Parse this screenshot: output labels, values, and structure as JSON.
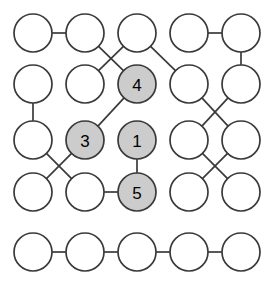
{
  "figure": {
    "width": 275,
    "height": 285,
    "background_color": "#ffffff"
  },
  "style": {
    "node_radius": 19,
    "node_stroke_color": "#3a3a3a",
    "node_stroke_width": 1.7,
    "node_fill_plain": "#ffffff",
    "node_fill_highlight": "#cccccc",
    "edge_color": "#3a3a3a",
    "edge_width": 1.7,
    "label_color": "#000000",
    "label_font_size": 17
  },
  "chart_data": {
    "type": "diagram",
    "title": "",
    "grid": {
      "columns": 5,
      "rows": 5,
      "column_centers_x": [
        33,
        85,
        137,
        189,
        241
      ],
      "row_centers_y": [
        33,
        84,
        140,
        192,
        252
      ]
    },
    "nodes": [
      {
        "id": "r1c1",
        "row": 1,
        "col": 1,
        "cx": 33,
        "cy": 33,
        "label": "",
        "highlighted": false
      },
      {
        "id": "r1c2",
        "row": 1,
        "col": 2,
        "cx": 85,
        "cy": 33,
        "label": "",
        "highlighted": false
      },
      {
        "id": "r1c3",
        "row": 1,
        "col": 3,
        "cx": 137,
        "cy": 33,
        "label": "",
        "highlighted": false
      },
      {
        "id": "r1c4",
        "row": 1,
        "col": 4,
        "cx": 189,
        "cy": 33,
        "label": "",
        "highlighted": false
      },
      {
        "id": "r1c5",
        "row": 1,
        "col": 5,
        "cx": 241,
        "cy": 33,
        "label": "",
        "highlighted": false
      },
      {
        "id": "r2c1",
        "row": 2,
        "col": 1,
        "cx": 33,
        "cy": 84,
        "label": "",
        "highlighted": false
      },
      {
        "id": "r2c2",
        "row": 2,
        "col": 2,
        "cx": 85,
        "cy": 84,
        "label": "",
        "highlighted": false
      },
      {
        "id": "r2c3",
        "row": 2,
        "col": 3,
        "cx": 137,
        "cy": 84,
        "label": "4",
        "highlighted": true
      },
      {
        "id": "r2c4",
        "row": 2,
        "col": 4,
        "cx": 189,
        "cy": 84,
        "label": "",
        "highlighted": false
      },
      {
        "id": "r2c5",
        "row": 2,
        "col": 5,
        "cx": 241,
        "cy": 84,
        "label": "",
        "highlighted": false
      },
      {
        "id": "r3c1",
        "row": 3,
        "col": 1,
        "cx": 33,
        "cy": 140,
        "label": "",
        "highlighted": false
      },
      {
        "id": "r3c2",
        "row": 3,
        "col": 2,
        "cx": 85,
        "cy": 140,
        "label": "3",
        "highlighted": true
      },
      {
        "id": "r3c3",
        "row": 3,
        "col": 3,
        "cx": 137,
        "cy": 140,
        "label": "1",
        "highlighted": true
      },
      {
        "id": "r3c4",
        "row": 3,
        "col": 4,
        "cx": 189,
        "cy": 140,
        "label": "",
        "highlighted": false
      },
      {
        "id": "r3c5",
        "row": 3,
        "col": 5,
        "cx": 241,
        "cy": 140,
        "label": "",
        "highlighted": false
      },
      {
        "id": "r4c1",
        "row": 4,
        "col": 1,
        "cx": 33,
        "cy": 192,
        "label": "",
        "highlighted": false
      },
      {
        "id": "r4c2",
        "row": 4,
        "col": 2,
        "cx": 85,
        "cy": 192,
        "label": "",
        "highlighted": false
      },
      {
        "id": "r4c3",
        "row": 4,
        "col": 3,
        "cx": 137,
        "cy": 192,
        "label": "5",
        "highlighted": true
      },
      {
        "id": "r4c4",
        "row": 4,
        "col": 4,
        "cx": 189,
        "cy": 192,
        "label": "",
        "highlighted": false
      },
      {
        "id": "r4c5",
        "row": 4,
        "col": 5,
        "cx": 241,
        "cy": 192,
        "label": "",
        "highlighted": false
      },
      {
        "id": "r5c1",
        "row": 5,
        "col": 1,
        "cx": 33,
        "cy": 252,
        "label": "",
        "highlighted": false
      },
      {
        "id": "r5c2",
        "row": 5,
        "col": 2,
        "cx": 85,
        "cy": 252,
        "label": "",
        "highlighted": false
      },
      {
        "id": "r5c3",
        "row": 5,
        "col": 3,
        "cx": 137,
        "cy": 252,
        "label": "",
        "highlighted": false
      },
      {
        "id": "r5c4",
        "row": 5,
        "col": 4,
        "cx": 189,
        "cy": 252,
        "label": "",
        "highlighted": false
      },
      {
        "id": "r5c5",
        "row": 5,
        "col": 5,
        "cx": 241,
        "cy": 252,
        "label": "",
        "highlighted": false
      }
    ],
    "edges": [
      {
        "from": "r1c1",
        "to": "r1c2"
      },
      {
        "from": "r1c4",
        "to": "r1c5"
      },
      {
        "from": "r1c2",
        "to": "r2c3"
      },
      {
        "from": "r1c3",
        "to": "r2c2"
      },
      {
        "from": "r1c3",
        "to": "r2c4"
      },
      {
        "from": "r1c5",
        "to": "r2c5"
      },
      {
        "from": "r2c1",
        "to": "r3c1"
      },
      {
        "from": "r2c3",
        "to": "r3c2"
      },
      {
        "from": "r2c4",
        "to": "r3c5"
      },
      {
        "from": "r2c5",
        "to": "r3c4"
      },
      {
        "from": "r3c1",
        "to": "r4c2"
      },
      {
        "from": "r3c2",
        "to": "r4c1"
      },
      {
        "from": "r3c3",
        "to": "r4c3"
      },
      {
        "from": "r3c4",
        "to": "r4c5"
      },
      {
        "from": "r3c5",
        "to": "r4c4"
      },
      {
        "from": "r4c2",
        "to": "r4c3"
      },
      {
        "from": "r5c1",
        "to": "r5c2"
      },
      {
        "from": "r5c2",
        "to": "r5c3"
      },
      {
        "from": "r5c3",
        "to": "r5c4"
      },
      {
        "from": "r5c4",
        "to": "r5c5"
      }
    ],
    "highlighted_labels": [
      "1",
      "3",
      "4",
      "5"
    ],
    "node_count": 25,
    "edge_count": 20
  }
}
